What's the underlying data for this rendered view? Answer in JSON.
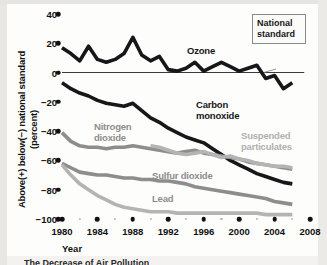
{
  "axes": {
    "y_title_line1": "Above(+) below(−) national standard",
    "y_title_line2": "(percent)",
    "x_title": "Year",
    "y_ticks": [
      "40",
      "20",
      "0",
      "−20",
      "−40",
      "−60",
      "−80",
      "−100"
    ],
    "x_ticks": [
      "1980",
      "1984",
      "1988",
      "1992",
      "1996",
      "2000",
      "2004",
      "2008"
    ]
  },
  "callout": {
    "line1": "National",
    "line2": "standard"
  },
  "series_labels": {
    "ozone": "Ozone",
    "carbon_monoxide_l1": "Carbon",
    "carbon_monoxide_l2": "monoxide",
    "nitrogen_dioxide_l1": "Nitrogen",
    "nitrogen_dioxide_l2": "dioxide",
    "suspended_particulates_l1": "Suspended",
    "suspended_particulates_l2": "particulates",
    "sulfur_dioxide": "Sulfur dioxide",
    "lead": "Lead"
  },
  "caption": "The Decrease of Air Pollution",
  "colors": {
    "dark_line": "#17171a",
    "mid_gray_line": "#8d8d8d",
    "light_gray_line": "#b4b4b4",
    "axis_text": "#111111",
    "zero_line": "#3a3a3a",
    "plate": "#fdfdfc"
  },
  "chart_data": {
    "type": "line",
    "title": "The Decrease of Air Pollution",
    "xlabel": "Year",
    "ylabel": "Above(+) below(−) national standard (percent)",
    "xlim": [
      1980,
      2008
    ],
    "ylim": [
      -100,
      40
    ],
    "grid": false,
    "legend": "inline-labels",
    "annotations": [
      {
        "text": "National standard",
        "points_to": "zero-line",
        "x": 2005,
        "y": 0
      }
    ],
    "x": [
      1980,
      1981,
      1982,
      1983,
      1984,
      1985,
      1986,
      1987,
      1988,
      1989,
      1990,
      1991,
      1992,
      1993,
      1994,
      1995,
      1996,
      1997,
      1998,
      1999,
      2000,
      2001,
      2002,
      2003,
      2004,
      2005,
      2006
    ],
    "series": [
      {
        "name": "Ozone",
        "color": "#17171a",
        "values": [
          17,
          13,
          8,
          18,
          9,
          7,
          9,
          13,
          24,
          12,
          8,
          11,
          2,
          1,
          3,
          7,
          1,
          4,
          7,
          4,
          1,
          3,
          5,
          -4,
          -2,
          -11,
          -7
        ]
      },
      {
        "name": "Carbon monoxide",
        "color": "#17171a",
        "values": [
          -7,
          -11,
          -14,
          -16,
          -19,
          -21,
          -22,
          -23,
          -21,
          -26,
          -31,
          -34,
          -38,
          -41,
          -44,
          -46,
          -48,
          -52,
          -56,
          -60,
          -63,
          -66,
          -69,
          -71,
          -73,
          -75,
          -76
        ]
      },
      {
        "name": "Nitrogen dioxide",
        "color": "#8d8d8d",
        "values": [
          -41,
          -47,
          -50,
          -51,
          -51,
          -52,
          -51,
          -51,
          -50,
          -51,
          -52,
          -53,
          -54,
          -55,
          -54,
          -53,
          -55,
          -56,
          -57,
          -58,
          -59,
          -61,
          -62,
          -63,
          -64,
          -65,
          -66
        ]
      },
      {
        "name": "Suspended particulates",
        "color": "#b4b4b4",
        "start_year": 1990,
        "values": [
          null,
          null,
          null,
          null,
          null,
          null,
          null,
          null,
          null,
          null,
          -50,
          -51,
          -53,
          -55,
          -56,
          -55,
          -54,
          -56,
          -58,
          -57,
          -59,
          -60,
          -62,
          -63,
          -64,
          -64,
          -65
        ]
      },
      {
        "name": "Sulfur dioxide",
        "color": "#8d8d8d",
        "values": [
          -62,
          -65,
          -68,
          -69,
          -70,
          -70,
          -71,
          -72,
          -72,
          -73,
          -73,
          -74,
          -74,
          -75,
          -76,
          -78,
          -79,
          -80,
          -81,
          -82,
          -83,
          -84,
          -85,
          -86,
          -88,
          -89,
          -90
        ]
      },
      {
        "name": "Lead",
        "color": "#b4b4b4",
        "values": [
          -63,
          -70,
          -76,
          -80,
          -84,
          -87,
          -90,
          -92,
          -93,
          -94,
          -95,
          -95,
          -95,
          -96,
          -96,
          -96,
          -96,
          -96,
          -96,
          -96,
          -96,
          -96,
          -96,
          -97,
          -97,
          -97,
          -97
        ]
      }
    ]
  }
}
